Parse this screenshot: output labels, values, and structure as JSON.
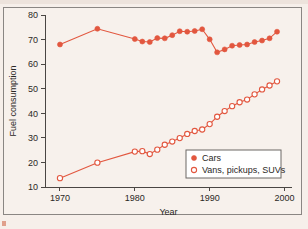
{
  "figure": {
    "background_color": "#f6efea",
    "frame_color": "#8a8683",
    "accent_color": "#e2573f"
  },
  "chart_data": {
    "type": "line",
    "title": "",
    "xlabel": "Year",
    "ylabel": "Fuel consumption",
    "xlim": [
      1968,
      2001
    ],
    "ylim": [
      10,
      80
    ],
    "xticks": [
      1970,
      1980,
      1990,
      2000
    ],
    "yticks": [
      10,
      20,
      30,
      40,
      50,
      60,
      70,
      80
    ],
    "grid": false,
    "legend_position": "lower right",
    "series": [
      {
        "name": "Cars",
        "marker": "filled-circle",
        "color": "#e2573f",
        "x": [
          1970,
          1975,
          1980,
          1981,
          1982,
          1983,
          1984,
          1985,
          1986,
          1987,
          1988,
          1989,
          1990,
          1991,
          1992,
          1993,
          1994,
          1995,
          1996,
          1997,
          1998,
          1999
        ],
        "values": [
          68.0,
          74.4,
          70.2,
          69.2,
          69.0,
          70.6,
          70.5,
          71.8,
          73.4,
          73.2,
          73.5,
          74.2,
          70.1,
          64.8,
          66.0,
          67.5,
          67.8,
          68.0,
          69.0,
          69.6,
          70.5,
          73.2
        ]
      },
      {
        "name": "Vans, pickups, SUVs",
        "marker": "open-circle",
        "color": "#e2573f",
        "x": [
          1970,
          1975,
          1980,
          1981,
          1982,
          1983,
          1984,
          1985,
          1986,
          1987,
          1988,
          1989,
          1990,
          1991,
          1992,
          1993,
          1994,
          1995,
          1996,
          1997,
          1998,
          1999
        ],
        "values": [
          13.6,
          19.9,
          24.4,
          24.6,
          23.4,
          25.2,
          27.2,
          28.5,
          29.9,
          31.6,
          32.8,
          33.4,
          35.6,
          38.6,
          40.9,
          42.9,
          44.5,
          45.6,
          47.7,
          49.7,
          51.3,
          53.0
        ]
      }
    ]
  }
}
